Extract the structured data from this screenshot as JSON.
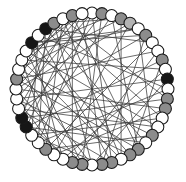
{
  "figure": {
    "title": "",
    "type": "circular-network-graph",
    "background_color": "#ffffff",
    "node_count": 48,
    "edge_count": 72,
    "layout": "circle",
    "center_x": 92,
    "center_y": 89,
    "radius": 76,
    "node_radius": 6.0,
    "start_angle_deg": -90,
    "edge_color": "#3a3a3a",
    "edge_width": 0.75,
    "node_outline_color": "#1a1a1a",
    "node_fill_palette": {
      "white": "#ffffff",
      "gray": "#8c8c8c",
      "light_gray": "#b3b3b3",
      "black": "#161616"
    },
    "legend": {
      "visible": false,
      "entries": []
    },
    "axes": {
      "visible": false,
      "grid": false
    }
  },
  "chart_data": {
    "type": "scatter",
    "title": "",
    "xlabel": "",
    "ylabel": "",
    "nodes": [
      {
        "id": 0,
        "color": "white"
      },
      {
        "id": 1,
        "color": "gray"
      },
      {
        "id": 2,
        "color": "white"
      },
      {
        "id": 3,
        "color": "gray"
      },
      {
        "id": 4,
        "color": "light_gray"
      },
      {
        "id": 5,
        "color": "white"
      },
      {
        "id": 6,
        "color": "gray"
      },
      {
        "id": 7,
        "color": "white"
      },
      {
        "id": 8,
        "color": "white"
      },
      {
        "id": 9,
        "color": "gray"
      },
      {
        "id": 10,
        "color": "white"
      },
      {
        "id": 11,
        "color": "black"
      },
      {
        "id": 12,
        "color": "white"
      },
      {
        "id": 13,
        "color": "gray"
      },
      {
        "id": 14,
        "color": "gray"
      },
      {
        "id": 15,
        "color": "white"
      },
      {
        "id": 16,
        "color": "white"
      },
      {
        "id": 17,
        "color": "gray"
      },
      {
        "id": 18,
        "color": "white"
      },
      {
        "id": 19,
        "color": "gray"
      },
      {
        "id": 20,
        "color": "gray"
      },
      {
        "id": 21,
        "color": "white"
      },
      {
        "id": 22,
        "color": "gray"
      },
      {
        "id": 23,
        "color": "gray"
      },
      {
        "id": 24,
        "color": "white"
      },
      {
        "id": 25,
        "color": "gray"
      },
      {
        "id": 26,
        "color": "gray"
      },
      {
        "id": 27,
        "color": "white"
      },
      {
        "id": 28,
        "color": "white"
      },
      {
        "id": 29,
        "color": "gray"
      },
      {
        "id": 30,
        "color": "white"
      },
      {
        "id": 31,
        "color": "white"
      },
      {
        "id": 32,
        "color": "black"
      },
      {
        "id": 33,
        "color": "black"
      },
      {
        "id": 34,
        "color": "white"
      },
      {
        "id": 35,
        "color": "white"
      },
      {
        "id": 36,
        "color": "white"
      },
      {
        "id": 37,
        "color": "gray"
      },
      {
        "id": 38,
        "color": "white"
      },
      {
        "id": 39,
        "color": "white"
      },
      {
        "id": 40,
        "color": "white"
      },
      {
        "id": 41,
        "color": "black"
      },
      {
        "id": 42,
        "color": "white"
      },
      {
        "id": 43,
        "color": "black"
      },
      {
        "id": 44,
        "color": "gray"
      },
      {
        "id": 45,
        "color": "white"
      },
      {
        "id": 46,
        "color": "gray"
      },
      {
        "id": 47,
        "color": "white"
      }
    ],
    "edges": [
      [
        0,
        22
      ],
      [
        0,
        30
      ],
      [
        0,
        35
      ],
      [
        1,
        25
      ],
      [
        1,
        33
      ],
      [
        2,
        19
      ],
      [
        2,
        31
      ],
      [
        3,
        21
      ],
      [
        3,
        38
      ],
      [
        3,
        44
      ],
      [
        4,
        28
      ],
      [
        4,
        36
      ],
      [
        5,
        17
      ],
      [
        5,
        40
      ],
      [
        6,
        23
      ],
      [
        6,
        34
      ],
      [
        6,
        41
      ],
      [
        7,
        29
      ],
      [
        7,
        43
      ],
      [
        8,
        26
      ],
      [
        8,
        37
      ],
      [
        9,
        20
      ],
      [
        9,
        32
      ],
      [
        10,
        27
      ],
      [
        10,
        39
      ],
      [
        11,
        24
      ],
      [
        11,
        35
      ],
      [
        12,
        30
      ],
      [
        12,
        42
      ],
      [
        13,
        33
      ],
      [
        13,
        45
      ],
      [
        14,
        28
      ],
      [
        14,
        36
      ],
      [
        15,
        31
      ],
      [
        15,
        44
      ],
      [
        16,
        34
      ],
      [
        16,
        40
      ],
      [
        17,
        38
      ],
      [
        17,
        29
      ],
      [
        18,
        32
      ],
      [
        18,
        43
      ],
      [
        19,
        37
      ],
      [
        19,
        46
      ],
      [
        20,
        35
      ],
      [
        20,
        41
      ],
      [
        21,
        39
      ],
      [
        21,
        45
      ],
      [
        22,
        34
      ],
      [
        22,
        42
      ],
      [
        23,
        31
      ],
      [
        23,
        47
      ],
      [
        24,
        38
      ],
      [
        24,
        44
      ],
      [
        25,
        36
      ],
      [
        25,
        40
      ],
      [
        26,
        33
      ],
      [
        26,
        46
      ],
      [
        27,
        35
      ],
      [
        27,
        41
      ],
      [
        28,
        39
      ],
      [
        29,
        45
      ],
      [
        30,
        43
      ],
      [
        31,
        42
      ],
      [
        32,
        47
      ],
      [
        33,
        44
      ],
      [
        34,
        46
      ],
      [
        36,
        47
      ],
      [
        37,
        45
      ],
      [
        38,
        46
      ],
      [
        39,
        47
      ],
      [
        40,
        2
      ],
      [
        41,
        5
      ]
    ]
  }
}
